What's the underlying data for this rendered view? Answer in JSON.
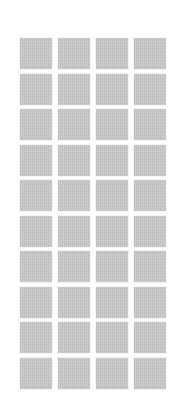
{
  "grid": {
    "rows": 10,
    "columns": 4,
    "tile_color": "#c9c9c9",
    "background_color": "#ffffff"
  }
}
